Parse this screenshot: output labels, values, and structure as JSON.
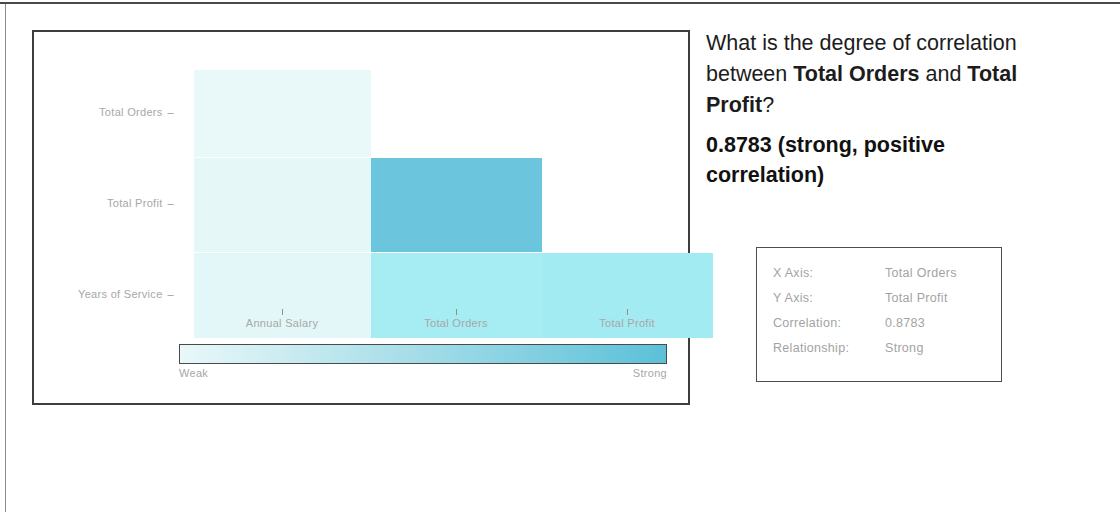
{
  "page": {
    "background": "#ffffff"
  },
  "chart_panel": {
    "border_color": "#3d3d3d"
  },
  "qa": {
    "question_prefix": "What is the degree of correlation between ",
    "question_bold_1": "Total Orders",
    "question_mid": " and ",
    "question_bold_2": "Total Profit",
    "question_suffix": "?",
    "answer": "0.8783 (strong, positive correlation)"
  },
  "info_box": {
    "rows": [
      {
        "key": "X Axis:",
        "value": "Total Orders"
      },
      {
        "key": "Y Axis:",
        "value": "Total Profit"
      },
      {
        "key": "Correlation:",
        "value": "0.8783"
      },
      {
        "key": "Relationship:",
        "value": "Strong"
      }
    ]
  },
  "colorbar": {
    "low_label": "Weak",
    "high_label": "Strong",
    "low_color": "#e9f8f8",
    "high_color": "#5cc0d8"
  },
  "chart_data": {
    "type": "heatmap",
    "title": "",
    "xlabel": "",
    "ylabel": "",
    "grid": false,
    "legend_position": "bottom",
    "note": "Lower-triangular correlation heatmap. Color encodes correlation strength from Weak (pale) to Strong (teal).",
    "x_categories": [
      "Annual Salary",
      "Total Orders",
      "Total Profit"
    ],
    "y_categories": [
      "Total Orders",
      "Total Profit",
      "Years of Service"
    ],
    "cells": [
      {
        "row": "Total Orders",
        "col": "Annual Salary",
        "value": 0.06,
        "color": "#e9f8f8"
      },
      {
        "row": "Total Profit",
        "col": "Annual Salary",
        "value": 0.07,
        "color": "#e6f7f8"
      },
      {
        "row": "Total Profit",
        "col": "Total Orders",
        "value": 0.8783,
        "color": "#6bc6dd"
      },
      {
        "row": "Years of Service",
        "col": "Annual Salary",
        "value": 0.08,
        "color": "#e4f7f8"
      },
      {
        "row": "Years of Service",
        "col": "Total Orders",
        "value": 0.47,
        "color": "#a6ecf3"
      },
      {
        "row": "Years of Service",
        "col": "Total Profit",
        "value": 0.46,
        "color": "#a3ebf2"
      }
    ],
    "colorbar": {
      "low_label": "Weak",
      "high_label": "Strong",
      "low_color": "#e9f8f8",
      "high_color": "#5cc0d8"
    }
  },
  "geometry": {
    "col_x": [
      160,
      337,
      508
    ],
    "col_w": [
      177,
      171,
      171
    ],
    "row_y": [
      38,
      126,
      221
    ],
    "row_h": [
      87,
      94,
      85
    ],
    "tick_x": [
      248,
      422,
      593
    ]
  }
}
